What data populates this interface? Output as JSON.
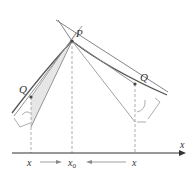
{
  "diagram": {
    "labels": {
      "point_p": "P",
      "point_q_left": "Q",
      "point_q_right": "Q",
      "x_left": "x",
      "x0": "x",
      "x0_sub": "0",
      "x_right": "x",
      "axis_x": "x"
    },
    "colors": {
      "curve": "#555555",
      "secant": "#8a8a8a",
      "tangent": "#6a6a6a",
      "axis": "#333333",
      "dashed": "#999999",
      "shade": "#e6e6e6"
    }
  }
}
